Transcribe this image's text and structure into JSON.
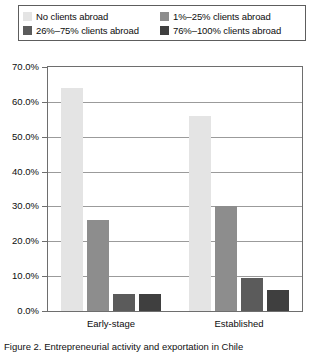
{
  "legend": {
    "entries": [
      {
        "label": "No clients abroad",
        "color": "#e4e4e4"
      },
      {
        "label": "1%–25% clients abroad",
        "color": "#8d8d8d"
      },
      {
        "label": "26%–75% clients abroad",
        "color": "#5b5b5b"
      },
      {
        "label": "76%–100% clients abroad",
        "color": "#3f3f3f"
      }
    ]
  },
  "axis": {
    "y_ticks": [
      "70.0%",
      "60.0%",
      "50.0%",
      "40.0%",
      "30.0%",
      "20.0%",
      "10.0%",
      "0.0%"
    ]
  },
  "categories": [
    "Early-stage",
    "Established"
  ],
  "caption": {
    "text": "Figure 2. Entrepreneurial activity and exportation in Chile"
  },
  "chart_data": {
    "type": "bar",
    "title": "",
    "subtitle": "",
    "xlabel": "",
    "ylabel": "",
    "ylim": [
      0,
      70
    ],
    "ytick_values": [
      0,
      10,
      20,
      30,
      40,
      50,
      60,
      70
    ],
    "ytick_labels": [
      "0.0%",
      "10.0%",
      "20.0%",
      "30.0%",
      "40.0%",
      "50.0%",
      "60.0%",
      "70.0%"
    ],
    "grid": "horizontal",
    "legend_position": "top",
    "categories": [
      "Early-stage",
      "Established"
    ],
    "series": [
      {
        "name": "No clients abroad",
        "color": "#e4e4e4",
        "values": [
          64.0,
          56.0
        ]
      },
      {
        "name": "1%–25% clients abroad",
        "color": "#8d8d8d",
        "values": [
          26.0,
          30.0
        ]
      },
      {
        "name": "26%–75% clients abroad",
        "color": "#5b5b5b",
        "values": [
          5.0,
          9.5
        ]
      },
      {
        "name": "76%–100% clients abroad",
        "color": "#3f3f3f",
        "values": [
          5.0,
          6.0
        ]
      }
    ]
  }
}
